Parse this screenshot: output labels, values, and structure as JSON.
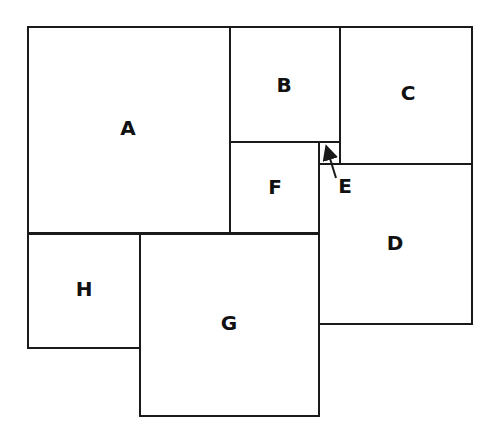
{
  "diagram": {
    "type": "square-tiling",
    "line_color": "#1a1a1a",
    "background": "#ffffff",
    "squares": [
      {
        "id": "A",
        "label": "A",
        "x": 27,
        "y": 26,
        "w": 204,
        "h": 208,
        "lx": 128,
        "ly": 128
      },
      {
        "id": "B",
        "label": "B",
        "x": 229,
        "y": 26,
        "w": 112,
        "h": 117,
        "lx": 284,
        "ly": 85
      },
      {
        "id": "C",
        "label": "C",
        "x": 339,
        "y": 26,
        "w": 134,
        "h": 139,
        "lx": 408,
        "ly": 93
      },
      {
        "id": "E",
        "label": "E",
        "x": 318,
        "y": 141,
        "w": 23,
        "h": 24,
        "lx": 345,
        "ly": 186
      },
      {
        "id": "F",
        "label": "F",
        "x": 229,
        "y": 141,
        "w": 91,
        "h": 93,
        "lx": 275,
        "ly": 187
      },
      {
        "id": "D",
        "label": "D",
        "x": 318,
        "y": 163,
        "w": 155,
        "h": 162,
        "lx": 395,
        "ly": 243
      },
      {
        "id": "H",
        "label": "H",
        "x": 27,
        "y": 233,
        "w": 114,
        "h": 116,
        "lx": 84,
        "ly": 289
      },
      {
        "id": "G",
        "label": "G",
        "x": 139,
        "y": 233,
        "w": 181,
        "h": 184,
        "lx": 229,
        "ly": 323
      }
    ],
    "arrow": {
      "target": "E",
      "x1": 336,
      "y1": 178,
      "x2": 328,
      "y2": 152
    }
  }
}
